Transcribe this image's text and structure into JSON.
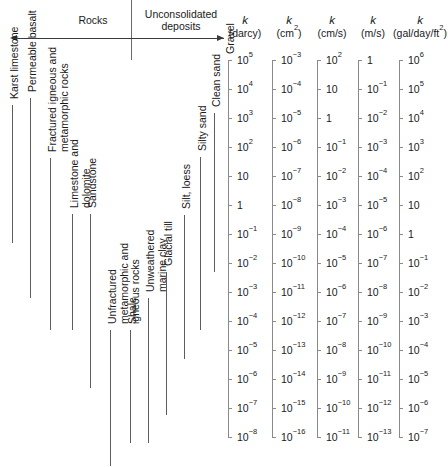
{
  "header": {
    "rocks_label": "Rocks",
    "unconsolidated_label": "Unconsolidated\ndeposits"
  },
  "chart_data": {
    "type": "table",
    "orientation": "vertical-log-scales",
    "grid": false,
    "legend": "none",
    "scales": [
      {
        "symbol": "k",
        "unit": "(darcy)",
        "ticks": [
          "10⁵",
          "10⁴",
          "10³",
          "10²",
          "10",
          "1",
          "10⁻¹",
          "10⁻²",
          "10⁻³",
          "10⁻⁴",
          "10⁻⁵",
          "10⁻⁶",
          "10⁻⁷",
          "10⁻⁸"
        ],
        "exponents": [
          5,
          4,
          3,
          2,
          1,
          0,
          -1,
          -2,
          -3,
          -4,
          -5,
          -6,
          -7,
          -8
        ]
      },
      {
        "symbol": "k",
        "unit": "(cm²)",
        "ticks": [
          "10⁻³",
          "10⁻⁴",
          "10⁻⁵",
          "10⁻⁶",
          "10⁻⁷",
          "10⁻⁸",
          "10⁻⁹",
          "10⁻¹⁰",
          "10⁻¹¹",
          "10⁻¹²",
          "10⁻¹³",
          "10⁻¹⁴",
          "10⁻¹⁵",
          "10⁻¹⁶"
        ],
        "exponents": [
          -3,
          -4,
          -5,
          -6,
          -7,
          -8,
          -9,
          -10,
          -11,
          -12,
          -13,
          -14,
          -15,
          -16
        ]
      },
      {
        "symbol": "k",
        "unit": "(cm/s)",
        "ticks": [
          "10²",
          "10",
          "1",
          "10⁻¹",
          "10⁻²",
          "10⁻³",
          "10⁻⁴",
          "10⁻⁵",
          "10⁻⁶",
          "10⁻⁷",
          "10⁻⁸",
          "10⁻⁹",
          "10⁻¹⁰",
          "10⁻¹¹"
        ],
        "exponents": [
          2,
          1,
          0,
          -1,
          -2,
          -3,
          -4,
          -5,
          -6,
          -7,
          -8,
          -9,
          -10,
          -11
        ]
      },
      {
        "symbol": "k",
        "unit": "(m/s)",
        "ticks": [
          "1",
          "10⁻¹",
          "10⁻²",
          "10⁻³",
          "10⁻⁴",
          "10⁻⁵",
          "10⁻⁶",
          "10⁻⁷",
          "10⁻⁸",
          "10⁻⁹",
          "10⁻¹⁰",
          "10⁻¹¹",
          "10⁻¹²",
          "10⁻¹³"
        ],
        "exponents": [
          0,
          -1,
          -2,
          -3,
          -4,
          -5,
          -6,
          -7,
          -8,
          -9,
          -10,
          -11,
          -12,
          -13
        ]
      },
      {
        "symbol": "k",
        "unit": "(gal/day/ft²)",
        "ticks": [
          "10⁶",
          "10⁵",
          "10⁴",
          "10³",
          "10²",
          "10",
          "1",
          "10⁻¹",
          "10⁻²",
          "10⁻³",
          "10⁻⁴",
          "10⁻⁵",
          "10⁻⁶",
          "10⁻⁷"
        ],
        "exponents": [
          6,
          5,
          4,
          3,
          2,
          1,
          0,
          -1,
          -2,
          -3,
          -4,
          -5,
          -6,
          -7
        ]
      }
    ],
    "categories": [
      {
        "label": "Karst limestone",
        "group": "rocks",
        "top": 105,
        "bottom": 243
      },
      {
        "label": "Permeable basalt",
        "group": "rocks",
        "top": 98,
        "bottom": 298
      },
      {
        "label": "Fractured igneous and\nmetamorphic rocks",
        "group": "rocks",
        "top": 158,
        "bottom": 330
      },
      {
        "label": "Limestone and\ndolomite",
        "group": "rocks",
        "top": 214,
        "bottom": 330
      },
      {
        "label": "Sandstone",
        "group": "rocks",
        "top": 214,
        "bottom": 388
      },
      {
        "label": "Unfractured\nmetamorphic and\nigneous rocks",
        "group": "rocks",
        "top": 330,
        "bottom": 466
      },
      {
        "label": "Shale",
        "group": "rocks",
        "top": 330,
        "bottom": 443
      },
      {
        "label": "Unweathered\nmarine clay",
        "group": "rocks",
        "top": 298,
        "bottom": 443
      },
      {
        "label": "Glacial till",
        "group": "unconsolidated",
        "top": 272,
        "bottom": 415
      },
      {
        "label": "Silt, loess",
        "group": "unconsolidated",
        "top": 215,
        "bottom": 359
      },
      {
        "label": "Silty sand",
        "group": "unconsolidated",
        "top": 157,
        "bottom": 330
      },
      {
        "label": "Clean sand",
        "group": "unconsolidated",
        "top": 113,
        "bottom": 272
      },
      {
        "label": "Gravel",
        "group": "unconsolidated",
        "top": 60,
        "bottom": 175
      }
    ]
  }
}
